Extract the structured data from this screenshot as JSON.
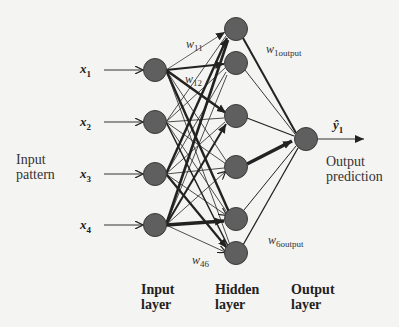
{
  "diagram": {
    "inputs": [
      {
        "var": "x",
        "sub": "1"
      },
      {
        "var": "x",
        "sub": "2"
      },
      {
        "var": "x",
        "sub": "3"
      },
      {
        "var": "x",
        "sub": "4"
      }
    ],
    "input_caption": [
      "Input",
      "pattern"
    ],
    "output_var": {
      "var": "ŷ",
      "sub": "1"
    },
    "output_caption": [
      "Output",
      "prediction"
    ],
    "weights": {
      "w11": {
        "var": "w",
        "sub": "11"
      },
      "w12": {
        "var": "w",
        "sub": "12"
      },
      "w46": {
        "var": "w",
        "sub": "46"
      },
      "w1output": {
        "var": "w",
        "sub": "1output"
      },
      "w6output": {
        "var": "w",
        "sub": "6output"
      }
    },
    "layers": [
      {
        "name": "Input",
        "line2": "layer",
        "nodes": 4
      },
      {
        "name": "Hidden",
        "line2": "layer",
        "nodes": 6
      },
      {
        "name": "Output",
        "line2": "layer",
        "nodes": 1
      }
    ],
    "colors": {
      "node_fill": "#5f5f5f",
      "node_stroke": "#3a3a3a",
      "edge": "#222222",
      "background": "#f4f4f2"
    }
  }
}
